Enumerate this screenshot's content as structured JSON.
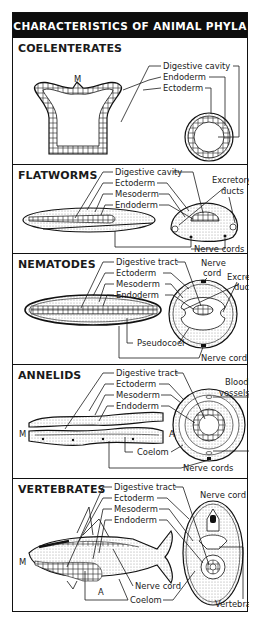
{
  "title": "CHARACTERISTICS OF ANIMAL PHYLA",
  "sections": [
    {
      "name": "COELENTERATES",
      "labels": [
        "Digestive cavity",
        "Endoderm",
        "Ectoderm"
      ],
      "markers": [
        "M"
      ]
    },
    {
      "name": "FLATWORMS",
      "labels": [
        "Digestive cavity",
        "Ectoderm",
        "Mesoderm",
        "Endoderm",
        "Excretory",
        "ducts",
        "Nerve cords"
      ]
    },
    {
      "name": "NEMATODES",
      "labels": [
        "Digestive tract",
        "Ectoderm",
        "Mesoderm",
        "Endoderm",
        "Nerve",
        "cord",
        "Excretory",
        "ducts",
        "Pseudocoel",
        "Nerve cord"
      ]
    },
    {
      "name": "ANNELIDS",
      "labels": [
        "Digestive tract",
        "Ectoderm",
        "Mesoderm",
        "Endoderm",
        "Blood",
        "vessels",
        "Coelom",
        "Nerve cords"
      ],
      "markers": [
        "M",
        "A"
      ]
    },
    {
      "name": "VERTEBRATES",
      "labels": [
        "Digestive tract",
        "Ectoderm",
        "Mesoderm",
        "Endoderm",
        "Nerve cord",
        "Nerve cord",
        "Coelom",
        "Vertebra"
      ],
      "markers": [
        "M",
        "A"
      ]
    }
  ],
  "colors": {
    "header_bg": "#0d0d0d",
    "header_text": "#ffffff",
    "line": "#1a1a1a",
    "stipple": "#cfcfcf"
  }
}
